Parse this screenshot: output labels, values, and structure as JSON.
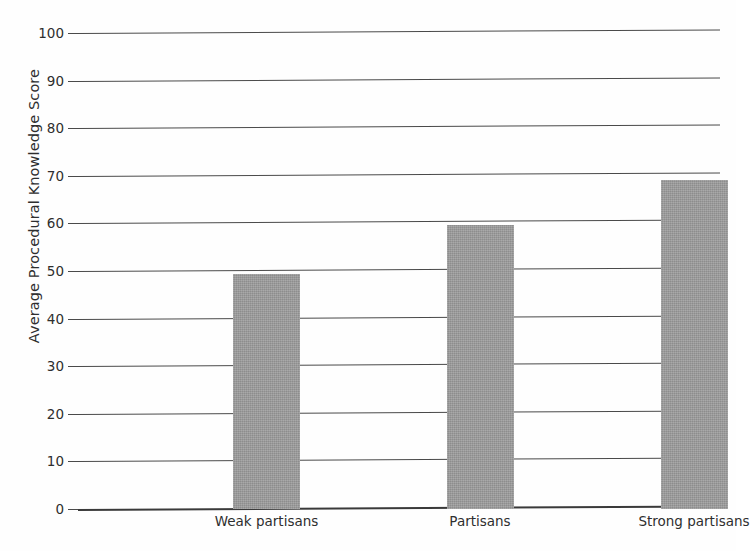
{
  "chart_data": {
    "type": "bar",
    "title": "",
    "xlabel": "",
    "ylabel": "Average Procedural Knowledge Score",
    "categories": [
      "Weak partisans",
      "Partisans",
      "Strong partisans"
    ],
    "values": [
      49.3,
      59.6,
      69.1
    ],
    "ylim": [
      0,
      100
    ],
    "y_ticks": [
      0,
      10,
      20,
      30,
      40,
      50,
      60,
      70,
      80,
      90,
      100
    ],
    "y_tick_labels": [
      "0",
      "10",
      "20",
      "30",
      "40",
      "50",
      "60",
      "70",
      "80",
      "90",
      "100"
    ],
    "grid": true,
    "legend": false,
    "legend_position": "none",
    "bar_color": "#9b9b9b",
    "gridline_color": "#4a4a4a",
    "axis_color": "#3a3a3a",
    "background_color": "#fefefe"
  }
}
